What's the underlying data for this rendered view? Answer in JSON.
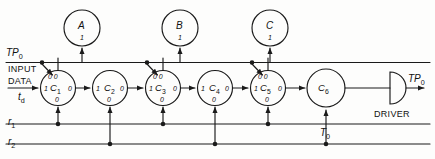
{
  "diagram": {
    "stroke_color": "#1a1a1a",
    "background_color": "#fdfdfc",
    "input": {
      "label_line1": "INPUT",
      "label_line2": "DATA",
      "delay_label": "t",
      "delay_sub": "d"
    },
    "clock_rail": {
      "label": "TP",
      "label_sub": "0"
    },
    "reset_rails": [
      {
        "label": "r",
        "sub": "1"
      },
      {
        "label": "r",
        "sub": "2"
      }
    ],
    "output": {
      "label": "TP",
      "label_sub": "0"
    },
    "driver": {
      "label": "DRIVER"
    },
    "t0_tap": {
      "label": "T",
      "sub": "0"
    },
    "state_circles": [
      {
        "name": "A",
        "terminal": "1"
      },
      {
        "name": "B",
        "terminal": "1"
      },
      {
        "name": "C",
        "terminal": "1"
      }
    ],
    "flipflops": [
      {
        "name": "C",
        "sub": "1",
        "top_terminal": "0 0",
        "left_terminal": "1",
        "right_terminal": "0",
        "bottom_terminal": "0"
      },
      {
        "name": "C",
        "sub": "2",
        "top_terminal": "",
        "left_terminal": "1",
        "right_terminal": "0",
        "bottom_terminal": "0"
      },
      {
        "name": "C",
        "sub": "3",
        "top_terminal": "0 0",
        "left_terminal": "1",
        "right_terminal": "0",
        "bottom_terminal": "0"
      },
      {
        "name": "C",
        "sub": "4",
        "top_terminal": "",
        "left_terminal": "1",
        "right_terminal": "0",
        "bottom_terminal": "0"
      },
      {
        "name": "C",
        "sub": "5",
        "top_terminal": "0 0",
        "left_terminal": "1",
        "right_terminal": "0",
        "bottom_terminal": "0"
      },
      {
        "name": "C",
        "sub": "6",
        "top_terminal": "",
        "left_terminal": "",
        "right_terminal": "",
        "bottom_terminal": ""
      }
    ]
  }
}
